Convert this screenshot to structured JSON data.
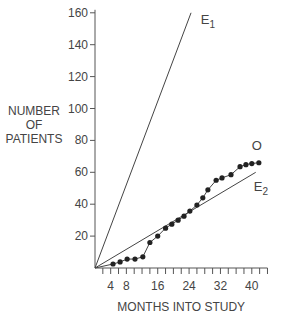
{
  "chart_data": {
    "type": "line",
    "title": "",
    "xlabel": "MONTHS INTO STUDY",
    "ylabel": [
      "NUMBER",
      "OF",
      "PATIENTS"
    ],
    "xlim": [
      0,
      44
    ],
    "ylim": [
      0,
      160
    ],
    "x_ticks": [
      4,
      8,
      16,
      24,
      32,
      40
    ],
    "y_ticks": [
      20,
      40,
      60,
      80,
      100,
      120,
      140,
      160
    ],
    "grid": false,
    "series": [
      {
        "name": "E1",
        "label_sub": "1",
        "style": "line",
        "x": [
          0,
          24.5
        ],
        "y": [
          0,
          160
        ]
      },
      {
        "name": "E2",
        "label_sub": "2",
        "style": "line",
        "x": [
          0,
          41
        ],
        "y": [
          0,
          60
        ]
      },
      {
        "name": "O",
        "style": "line+markers",
        "x": [
          4.6,
          6.4,
          8.2,
          10.2,
          12.2,
          14,
          16,
          18,
          19.6,
          21.2,
          22.7,
          24.2,
          26,
          27.5,
          28.8,
          30.9,
          32.4,
          34.7,
          37,
          38.5,
          40,
          41.8
        ],
        "y": [
          2.5,
          3.8,
          5.6,
          5.6,
          7,
          16,
          20,
          25,
          27.5,
          30,
          32.5,
          35.7,
          39.5,
          44,
          49,
          55,
          56.5,
          58.5,
          63.5,
          64.8,
          65.5,
          66
        ]
      }
    ],
    "annotations": [
      {
        "text": "E",
        "sub": "1",
        "x": 27,
        "y": 153
      },
      {
        "text": "O",
        "x": 40,
        "y": 74
      },
      {
        "text": "E",
        "sub": "2",
        "x": 40.5,
        "y": 48
      }
    ]
  }
}
